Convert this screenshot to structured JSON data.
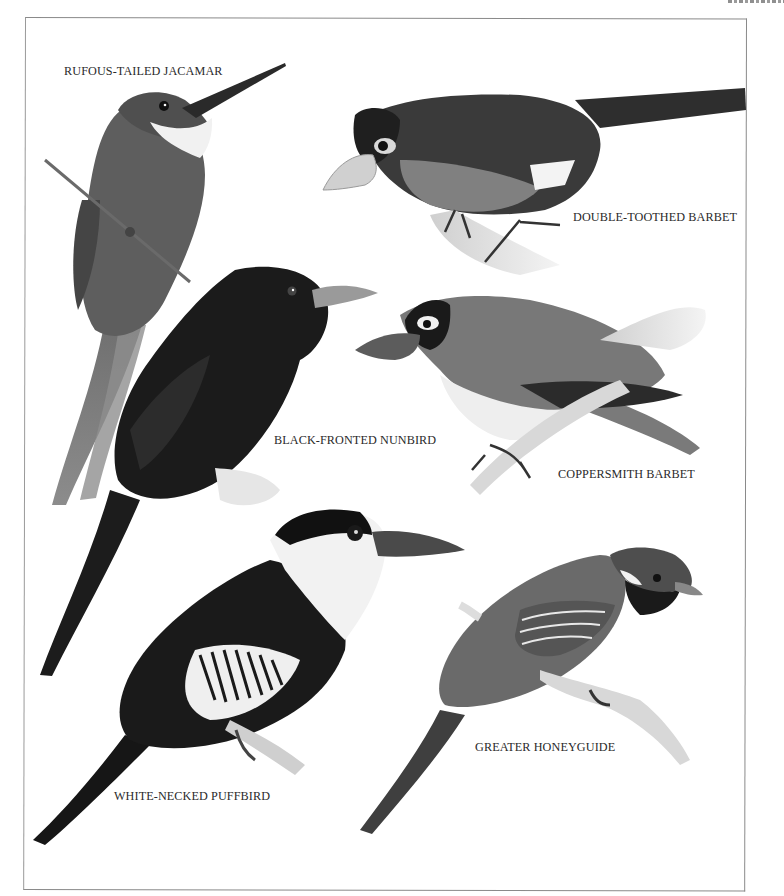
{
  "page": {
    "type": "illustrated bird plate",
    "running_head_fragment": "clipped",
    "colors": {
      "background": "#ffffff",
      "frame": "#8a8a8a",
      "label_text": "#2a2a2a"
    }
  },
  "plate": {
    "birds": [
      {
        "id": "rufous-tailed-jacamar",
        "label": "RUFOUS-TAILED JACAMAR"
      },
      {
        "id": "double-toothed-barbet",
        "label": "DOUBLE-TOOTHED BARBET"
      },
      {
        "id": "black-fronted-nunbird",
        "label": "BLACK-FRONTED NUNBIRD"
      },
      {
        "id": "coppersmith-barbet",
        "label": "COPPERSMITH BARBET"
      },
      {
        "id": "white-necked-puffbird",
        "label": "WHITE-NECKED PUFFBIRD"
      },
      {
        "id": "greater-honeyguide",
        "label": "GREATER HONEYGUIDE"
      }
    ]
  }
}
